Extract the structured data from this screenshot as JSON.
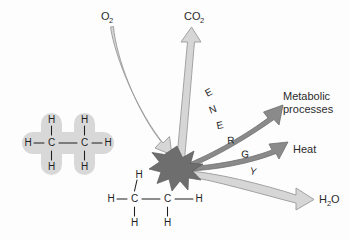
{
  "figure": {
    "background_color": "#fdfdfd"
  },
  "colors": {
    "light_arrow_fill": "#d6d6d6",
    "light_arrow_stroke": "#9a9a9a",
    "dark_arrow_fill": "#8a8a8a",
    "dark_arrow_stroke": "#6f6f6f",
    "burst_fill": "#6e6e6e",
    "burst_stroke": "#5a5a5a",
    "molecule_halo": "#d8d8d8",
    "text_color": "#2b2b2b",
    "bond_color": "#1f1f1f"
  },
  "labels": {
    "oxygen": {
      "formula": "O",
      "subscript": "2"
    },
    "carbon_dioxide": {
      "formula": "CO",
      "subscript": "2"
    },
    "water": {
      "formula": "H",
      "subscript": "2",
      "suffix": "O"
    },
    "metabolic_processes": {
      "line1": "Metabolic",
      "line2": "processes"
    },
    "heat": "Heat",
    "energy": "ENERGY",
    "energy_letters": [
      "E",
      "N",
      "E",
      "R",
      "G",
      "Y"
    ]
  },
  "molecules": {
    "reactant": {
      "name": "ethane-glucose-fuel-molecule",
      "backbone": [
        "C",
        "C"
      ],
      "hydrogens": [
        "H",
        "H",
        "H",
        "H",
        "H",
        "H"
      ],
      "has_halo": true,
      "bond_symbol": "–"
    },
    "product": {
      "name": "broken-fuel-molecule",
      "backbone": [
        "C",
        "C"
      ],
      "hydrogens": [
        "H",
        "H",
        "H",
        "H",
        "H"
      ],
      "has_halo": false,
      "bond_symbol": "–"
    }
  },
  "arrows": [
    {
      "name": "oxygen-input-arrow",
      "label": "O2",
      "direction": "down-right",
      "tone": "light"
    },
    {
      "name": "carbon-dioxide-output-arrow",
      "label": "CO2",
      "direction": "up",
      "tone": "light"
    },
    {
      "name": "water-output-arrow",
      "label": "H2O",
      "direction": "right-down",
      "tone": "light"
    },
    {
      "name": "metabolic-processes-arrow",
      "label": "Metabolic processes",
      "direction": "up-right",
      "tone": "dark"
    },
    {
      "name": "heat-arrow",
      "label": "Heat",
      "direction": "right",
      "tone": "dark"
    }
  ],
  "burst": {
    "name": "energy-release-burst",
    "points": 10
  }
}
